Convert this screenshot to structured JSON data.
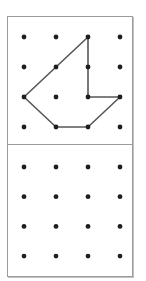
{
  "figure": {
    "kind": "geoboard-dot-grid-puzzle",
    "grid": {
      "rows": 4,
      "cols": 4
    },
    "colors": {
      "background": "#ffffff",
      "frame_border": "#9b9b9b",
      "divider": "#9b9b9b",
      "dot": "#1e1e1e",
      "shape_line": "#57575b"
    },
    "top_panel": {
      "role": "example-shape",
      "shape_vertices": [
        [
          3,
          1
        ],
        [
          1,
          3
        ],
        [
          2,
          4
        ],
        [
          3,
          4
        ],
        [
          4,
          3
        ],
        [
          3,
          3
        ]
      ]
    },
    "bottom_panel": {
      "role": "empty-copy-grid",
      "shape_vertices": []
    }
  }
}
